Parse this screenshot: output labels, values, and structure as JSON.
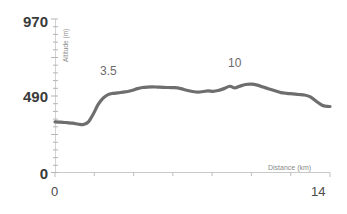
{
  "chart_data": {
    "type": "area",
    "title": "",
    "subtitle": "",
    "xlabel": "Distance (km)",
    "ylabel": "Altitude (m)",
    "xlim": [
      0,
      14
    ],
    "ylim": [
      0,
      970
    ],
    "grid": false,
    "legend": null,
    "y_tick_labels": [
      "970",
      "490",
      "0"
    ],
    "y_tick_values": [
      970,
      490,
      0
    ],
    "x_tick_labels": [
      "0",
      "14"
    ],
    "x_tick_values": [
      0,
      14
    ],
    "annotations": [
      {
        "label": "3.5",
        "x": 3.0,
        "y": 620
      },
      {
        "label": "10",
        "x": 9.6,
        "y": 690
      }
    ],
    "series": [
      {
        "name": "Elevation profile",
        "color": "#6e6e6e",
        "x": [
          0.0,
          0.3,
          0.6,
          0.9,
          1.2,
          1.45,
          1.7,
          1.95,
          2.2,
          2.45,
          2.7,
          2.95,
          3.2,
          3.45,
          3.7,
          3.95,
          4.2,
          4.45,
          4.7,
          4.95,
          5.2,
          5.5,
          5.8,
          6.1,
          6.4,
          6.7,
          7.0,
          7.3,
          7.55,
          7.8,
          8.05,
          8.3,
          8.6,
          8.9,
          9.15,
          9.4,
          9.7,
          10.0,
          10.3,
          10.6,
          10.9,
          11.2,
          11.5,
          11.8,
          12.1,
          12.4,
          12.7,
          13.0,
          13.3,
          13.6,
          13.85,
          14.0
        ],
        "y": [
          320,
          318,
          315,
          312,
          305,
          303,
          320,
          370,
          430,
          470,
          492,
          500,
          503,
          508,
          512,
          520,
          530,
          537,
          540,
          541,
          540,
          538,
          537,
          536,
          530,
          520,
          512,
          508,
          512,
          516,
          513,
          518,
          530,
          545,
          534,
          545,
          556,
          558,
          552,
          540,
          528,
          516,
          505,
          500,
          497,
          493,
          490,
          478,
          450,
          425,
          418,
          417
        ]
      }
    ]
  },
  "axis": {
    "y_axis_title": "Altitude (m)",
    "x_axis_title": "Distance (km)"
  }
}
